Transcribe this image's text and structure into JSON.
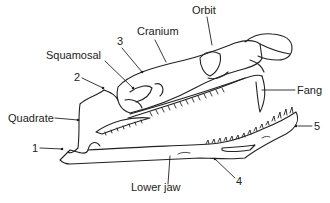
{
  "diagram": {
    "labels": {
      "cranium": "Cranium",
      "orbit": "Orbit",
      "squamosal": "Squamosal",
      "num3": "3",
      "num2": "2",
      "quadrate": "Quadrate",
      "num1": "1",
      "fang": "Fang",
      "num5": "5",
      "num4": "4",
      "lower_jaw": "Lower jaw"
    },
    "colors": {
      "ink": "#222222",
      "background": "#ffffff"
    }
  }
}
